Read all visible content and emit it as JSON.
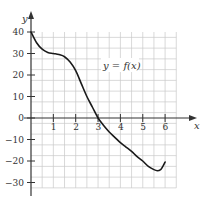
{
  "chart_data": {
    "type": "line",
    "title": "",
    "xlabel": "x",
    "ylabel": "y",
    "xlim": [
      0,
      6.5
    ],
    "ylim": [
      -33,
      45
    ],
    "x_ticks": [
      1,
      2,
      3,
      4,
      5,
      6
    ],
    "y_ticks": [
      -30,
      -20,
      -10,
      0,
      10,
      20,
      30,
      40
    ],
    "x_tick_labels": [
      "1",
      "2",
      "3",
      "4",
      "5",
      "6"
    ],
    "y_tick_labels": [
      "−30",
      "−20",
      "−10",
      "0",
      "10",
      "20",
      "30",
      "40"
    ],
    "grid": true,
    "grid_step": {
      "x": 0.5,
      "y": 5
    },
    "annotation": "y = f(x)",
    "series": [
      {
        "name": "f(x)",
        "x": [
          0,
          0.25,
          0.5,
          0.75,
          1,
          1.25,
          1.5,
          1.75,
          2,
          2.25,
          2.5,
          2.75,
          3,
          3.25,
          3.5,
          3.75,
          4,
          4.25,
          4.5,
          4.75,
          5,
          5.25,
          5.5,
          5.65,
          5.8,
          5.9,
          6
        ],
        "y": [
          40,
          35,
          32,
          30.5,
          30,
          29.5,
          28.5,
          26,
          22,
          16,
          10,
          5,
          0,
          -3.5,
          -6.5,
          -9,
          -11.5,
          -13.5,
          -15.5,
          -18,
          -20,
          -22.5,
          -24,
          -24.5,
          -24,
          -22.5,
          -20.5
        ]
      }
    ]
  },
  "labels": {
    "x_axis": "x",
    "y_axis": "y",
    "function_prefix": "y = ",
    "function_name": "f(x)"
  }
}
